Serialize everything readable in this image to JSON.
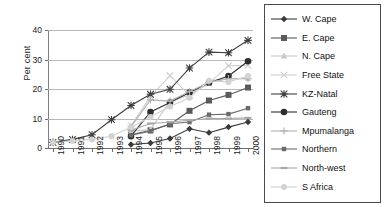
{
  "chart_data": {
    "type": "line",
    "title": "",
    "xlabel": "",
    "ylabel": "Per cent",
    "categories": [
      "1990",
      "1991",
      "1992",
      "1993",
      "1994",
      "1995",
      "1996",
      "1997",
      "1998",
      "1999",
      "2000"
    ],
    "ylim": [
      0,
      40
    ],
    "yticks": [
      0,
      10,
      20,
      30,
      40
    ],
    "grid": true,
    "legend_position": "right",
    "series": [
      {
        "name": "W. Cape",
        "marker": "diamond",
        "color": "#3a3a3a",
        "values": [
          null,
          null,
          null,
          null,
          1.2,
          1.7,
          3.2,
          6.5,
          5.2,
          7.1,
          8.8
        ]
      },
      {
        "name": "E. Cape",
        "marker": "square",
        "color": "#5a5a5a",
        "values": [
          null,
          null,
          null,
          null,
          4.5,
          6.0,
          8.0,
          12.6,
          16.1,
          18.0,
          20.5
        ]
      },
      {
        "name": "N. Cape",
        "marker": "triangle",
        "color": "#c8c8c8",
        "values": [
          null,
          null,
          null,
          null,
          5.7,
          6.3,
          15.8,
          18.0,
          22.8,
          23.5,
          23.6
        ]
      },
      {
        "name": "Free State",
        "marker": "cross",
        "color": "#cfcfcf",
        "values": [
          null,
          null,
          null,
          null,
          7.5,
          17.5,
          24.5,
          17.8,
          22.0,
          27.9,
          28.0
        ]
      },
      {
        "name": "KZ-Natal",
        "marker": "asterisk",
        "color": "#404040",
        "values": [
          1.9,
          2.9,
          4.5,
          9.6,
          14.4,
          18.2,
          19.9,
          27.1,
          32.5,
          32.3,
          36.5
        ]
      },
      {
        "name": "Gauteng",
        "marker": "circle",
        "color": "#2e2e2e",
        "values": [
          null,
          null,
          null,
          null,
          4.0,
          12.2,
          15.4,
          18.8,
          22.1,
          24.4,
          29.4
        ]
      },
      {
        "name": "Mpumalanga",
        "marker": "plus",
        "color": "#b0b0b0",
        "values": [
          null,
          null,
          null,
          null,
          7.2,
          16.3,
          15.9,
          19.2,
          22.2,
          23.5,
          23.5
        ]
      },
      {
        "name": "Northern",
        "marker": "small-square",
        "color": "#6b6b6b",
        "values": [
          null,
          null,
          null,
          null,
          4.3,
          5.7,
          8.2,
          8.8,
          11.3,
          11.5,
          13.5
        ]
      },
      {
        "name": "North-west",
        "marker": "dash",
        "color": "#a8a8a8",
        "values": [
          null,
          null,
          null,
          null,
          6.0,
          8.3,
          8.8,
          9.4,
          10.0,
          10.0,
          10.2
        ]
      },
      {
        "name": "S Africa",
        "marker": "light-circle",
        "color": "#d2d2d2",
        "values": [
          1.9,
          2.4,
          2.9,
          4.0,
          7.0,
          10.5,
          14.1,
          17.0,
          22.8,
          22.4,
          24.4
        ]
      }
    ]
  }
}
